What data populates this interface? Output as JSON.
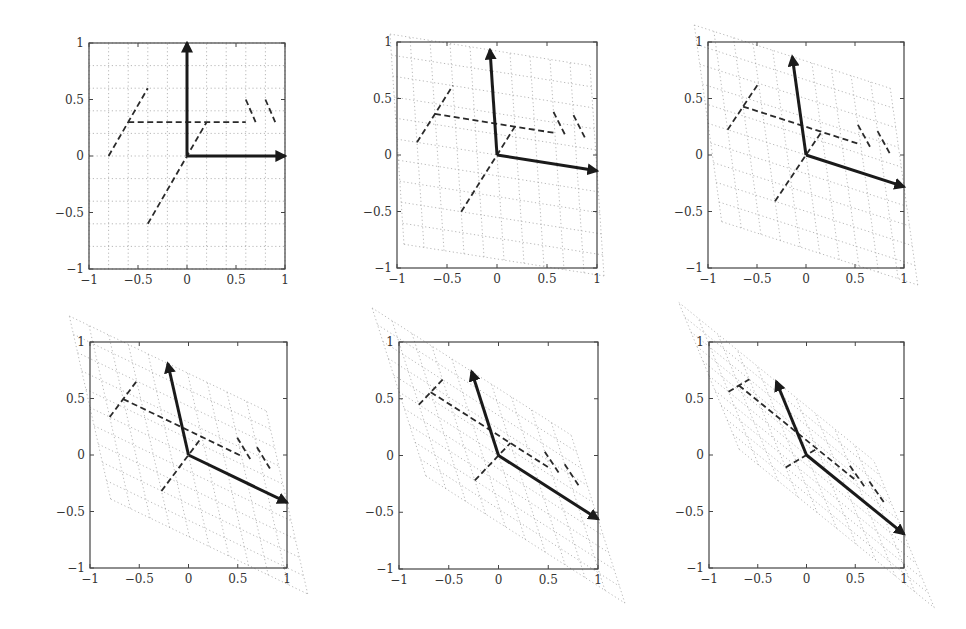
{
  "chart_data": {
    "type": "line",
    "title": "",
    "layout": {
      "rows": 2,
      "cols": 3
    },
    "xlim": [
      -1,
      1
    ],
    "ylim": [
      -1,
      1
    ],
    "xticks": [
      "-1",
      "-0.5",
      "0",
      "0.5",
      "1"
    ],
    "yticks": [
      "-1",
      "-0.5",
      "0",
      "0.5",
      "1"
    ],
    "xtick_values": [
      -1,
      -0.5,
      0,
      0.5,
      1
    ],
    "ytick_values": [
      -1,
      -0.5,
      0,
      0.5,
      1
    ],
    "grid": {
      "style": "dotted",
      "step": 0.2,
      "range": [
        -1,
        1
      ]
    },
    "base_shape": {
      "style": "dashed",
      "segments": [
        [
          [
            -0.8,
            0.0
          ],
          [
            -0.4,
            0.6
          ]
        ],
        [
          [
            -0.6,
            0.3
          ],
          [
            0.6,
            0.3
          ]
        ],
        [
          [
            -0.4,
            -0.6
          ],
          [
            0.2,
            0.3
          ]
        ],
        [
          [
            0.6,
            0.5
          ],
          [
            0.7,
            0.3
          ]
        ],
        [
          [
            0.8,
            0.5
          ],
          [
            0.9,
            0.3
          ]
        ]
      ]
    },
    "basis_vectors": [
      [
        1,
        0
      ],
      [
        0,
        1
      ]
    ],
    "panels": [
      {
        "index": 1,
        "matrix": [
          [
            1,
            0
          ],
          [
            0,
            1
          ]
        ],
        "box": [
          89,
          43,
          285,
          269
        ]
      },
      {
        "index": 2,
        "matrix": [
          [
            1,
            -0.07
          ],
          [
            -0.14,
            0.93
          ]
        ],
        "box": [
          397,
          42,
          597,
          268
        ]
      },
      {
        "index": 3,
        "matrix": [
          [
            1,
            -0.14
          ],
          [
            -0.28,
            0.87
          ]
        ],
        "box": [
          708,
          42,
          904,
          268
        ]
      },
      {
        "index": 4,
        "matrix": [
          [
            1,
            -0.21
          ],
          [
            -0.42,
            0.81
          ]
        ],
        "box": [
          90,
          342,
          287,
          568
        ]
      },
      {
        "index": 5,
        "matrix": [
          [
            1,
            -0.27
          ],
          [
            -0.56,
            0.74
          ]
        ],
        "box": [
          399,
          342,
          598,
          569
        ]
      },
      {
        "index": 6,
        "matrix": [
          [
            1,
            -0.31
          ],
          [
            -0.7,
            0.65
          ]
        ],
        "box": [
          709,
          342,
          904,
          568
        ]
      }
    ],
    "colors": {
      "grid": "#9a9a9a",
      "shape": "#2a2a2a",
      "vectors": "#1a1a1a",
      "axes": "#444444"
    }
  }
}
